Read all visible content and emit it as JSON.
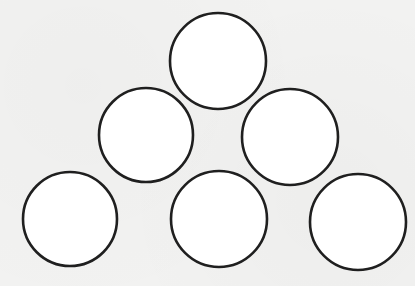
{
  "diagram": {
    "type": "triangular-arrangement-of-circles",
    "background_color": "#f2f2f1",
    "circle_fill": "#ffffff",
    "circle_stroke": "#1f1f1f",
    "rows": [
      {
        "row": 1,
        "count": 1
      },
      {
        "row": 2,
        "count": 2
      },
      {
        "row": 3,
        "count": 3
      }
    ],
    "circles": [
      {
        "id": "top",
        "cx": 218,
        "cy": 61,
        "r": 48
      },
      {
        "id": "middle-left",
        "cx": 146,
        "cy": 135,
        "r": 47
      },
      {
        "id": "middle-right",
        "cx": 290,
        "cy": 137,
        "r": 48
      },
      {
        "id": "bottom-left",
        "cx": 70,
        "cy": 219,
        "r": 47
      },
      {
        "id": "bottom-middle",
        "cx": 219,
        "cy": 219,
        "r": 48
      },
      {
        "id": "bottom-right",
        "cx": 358,
        "cy": 222,
        "r": 48
      }
    ],
    "total_circles": 6
  }
}
